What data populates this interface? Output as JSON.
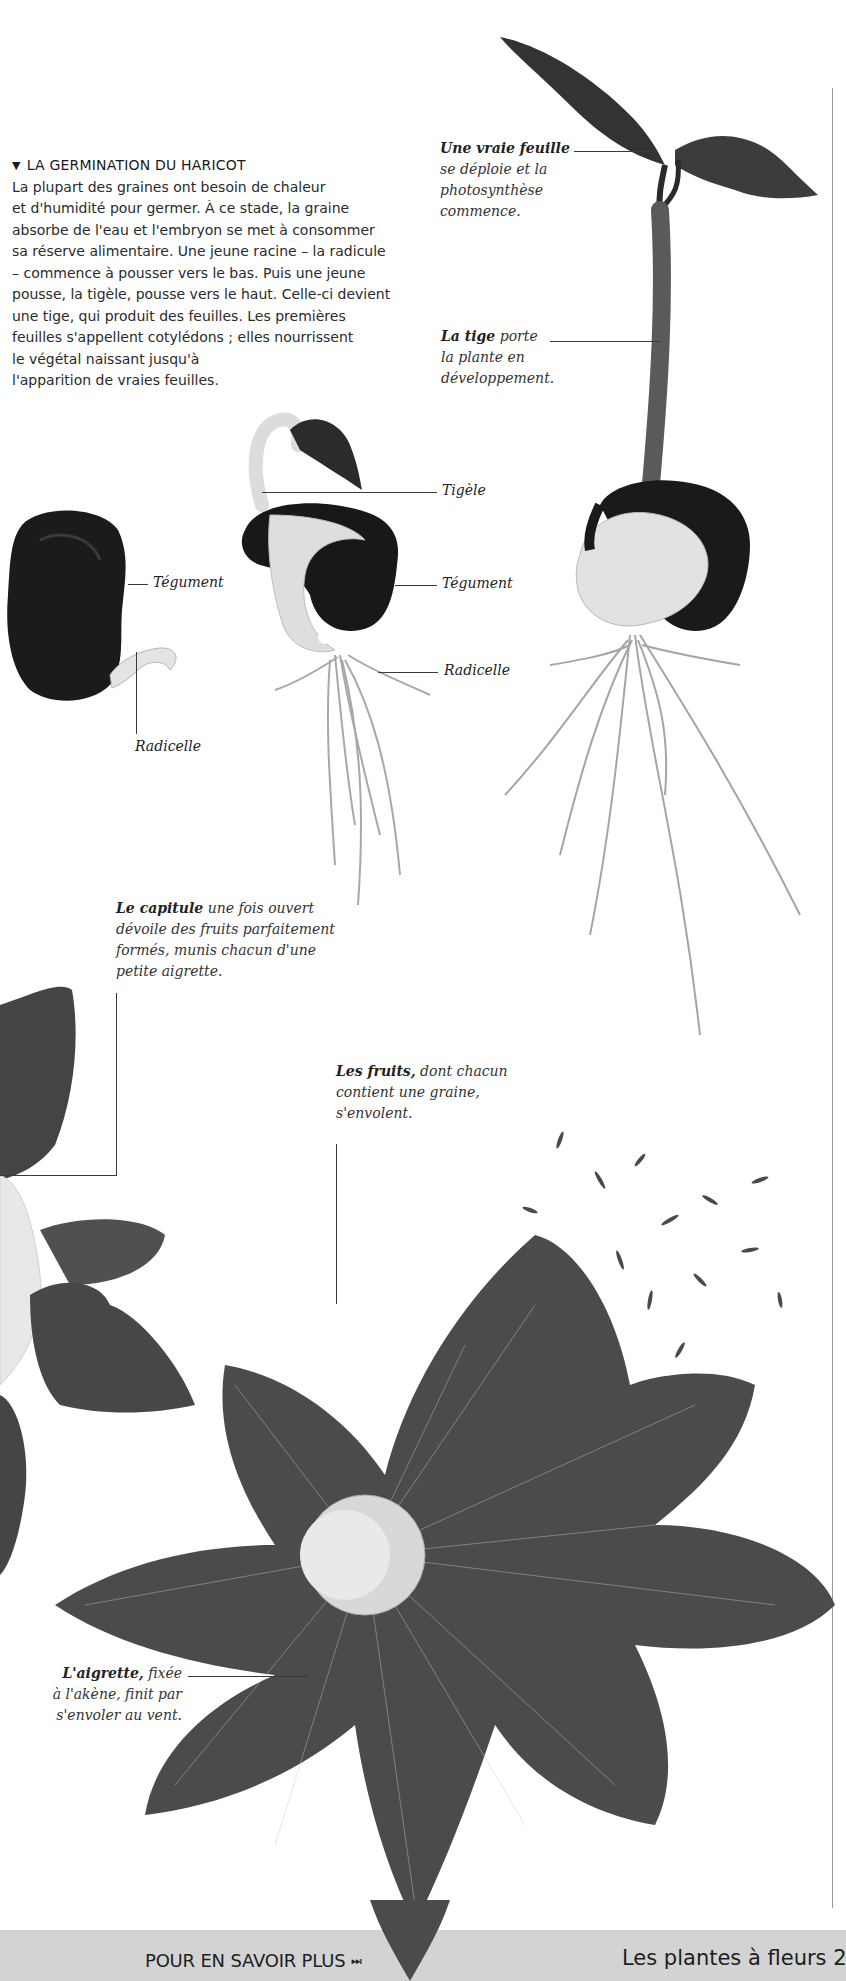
{
  "intro": {
    "heading_marker": "▼",
    "heading": "LA GERMINATION DU HARICOT",
    "lines": [
      "La plupart des graines ont besoin de chaleur",
      "et d'humidité pour germer. À ce stade, la graine",
      "absorbe de l'eau et l'embryon se met à consommer",
      "sa réserve alimentaire. Une jeune racine – la radicule",
      "– commence à pousser vers le bas. Puis une jeune",
      "pousse, la tigèle, pousse vers le haut. Celle-ci devient",
      "une tige, qui produit des feuilles. Les premières",
      "feuilles s'appellent cotylédons ; elles nourrissent",
      "le végétal naissant jusqu'à",
      "l'apparition de vraies feuilles."
    ]
  },
  "captions": {
    "vraie_feuille": {
      "bold": "Une vraie feuille",
      "lines": [
        "se déploie et la",
        "photosynthèse",
        "commence."
      ]
    },
    "tige": {
      "bold": "La tige",
      "rest": " porte",
      "lines": [
        "la plante en",
        "développement."
      ]
    },
    "capitule": {
      "bold": "Le capitule",
      "rest": " une fois ouvert",
      "lines": [
        "dévoile des fruits parfaitement",
        "formés, munis chacun d'une",
        "petite aigrette."
      ]
    },
    "fruits": {
      "bold": "Les fruits,",
      "rest": " dont chacun",
      "lines": [
        "contient une graine,",
        "s'envolent."
      ]
    },
    "aigrette": {
      "bold": "L'aigrette,",
      "rest": " fixée",
      "lines": [
        "à l'akène, finit par",
        "s'envoler au vent."
      ]
    }
  },
  "labels": {
    "seed_tegument": "Tégument",
    "seed_radicelle": "Radicelle",
    "sprout_tigele": "Tigèle",
    "sprout_tegument": "Tégument",
    "sprout_radicelle": "Radicelle"
  },
  "footer": {
    "more_label": "POUR EN SAVOIR PLUS",
    "more_icon": "⏭",
    "chapter_title": "Les plantes à fleurs 2"
  },
  "colors": {
    "footer_bg": "#d3d3d3",
    "seed_coat": "#1b1b1b",
    "leaf": "#4a4a4a",
    "stem": "#d9d9d9"
  }
}
